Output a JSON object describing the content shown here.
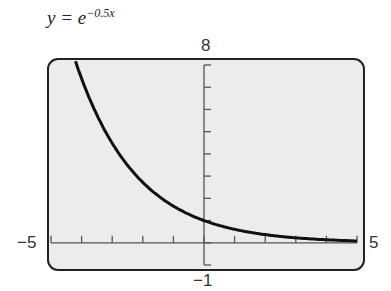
{
  "title": {
    "lhs": "y = e",
    "exponent": "−0.5x"
  },
  "window": {
    "xmin_label": "−5",
    "xmax_label": "5",
    "ymax_label": "8",
    "ymin_label": "−1"
  },
  "chart_data": {
    "type": "line",
    "xlabel": "",
    "ylabel": "",
    "xlim": [
      -5,
      5
    ],
    "ylim": [
      -1,
      8
    ],
    "xticks_step": 1,
    "yticks_step": 1,
    "grid": false,
    "series": [
      {
        "name": "y = e^(-0.5x)",
        "function": "exp(-0.5*x)",
        "x": [
          -4.2,
          -4,
          -3,
          -2,
          -1,
          0,
          1,
          2,
          3,
          4,
          5
        ],
        "y": [
          8.17,
          7.39,
          4.48,
          2.72,
          1.65,
          1.0,
          0.61,
          0.37,
          0.22,
          0.14,
          0.08
        ]
      }
    ]
  }
}
